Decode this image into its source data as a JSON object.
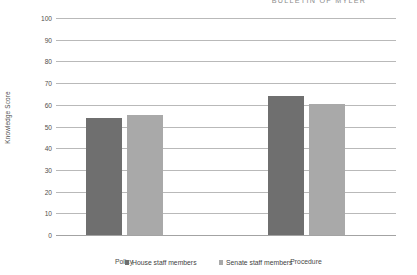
{
  "page": {
    "running_header": "BULLETIN OF MYLER"
  },
  "chart_data": {
    "type": "bar",
    "title": "",
    "subtitle": "",
    "xlabel": "",
    "ylabel": "Knowledge Score",
    "ylim": [
      0,
      100
    ],
    "ytick_step": 10,
    "yticks": [
      100,
      90,
      80,
      70,
      60,
      50,
      40,
      30,
      20,
      10,
      0
    ],
    "ytick_labels": [
      "100",
      "90",
      "80",
      "70",
      "60",
      "50",
      "40",
      "30",
      "20",
      "10",
      "0"
    ],
    "grid": true,
    "grid_axis": "y",
    "legend_position": "bottom",
    "categories": [
      "Policy",
      "Procedure"
    ],
    "series": [
      {
        "name": "House staff members",
        "color": "#6f6f6f",
        "values": [
          54,
          64
        ]
      },
      {
        "name": "Senate staff members",
        "color": "#a9a9a9",
        "values": [
          55.5,
          60.5
        ]
      }
    ]
  },
  "colors": {
    "house": "#6f6f6f",
    "senate": "#a9a9a9",
    "gridline": "#b9b9b9",
    "axis": "#a3a3a3",
    "text": "#4a4a4a",
    "background": "#ffffff"
  }
}
